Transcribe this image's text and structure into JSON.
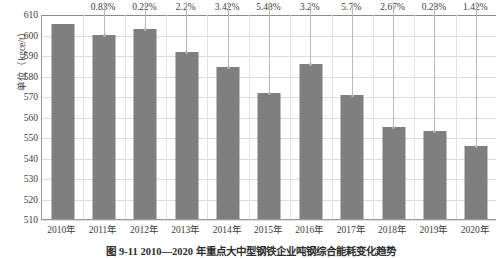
{
  "chart_data": {
    "type": "bar",
    "title": "图 9-11  2010—2020 年重点大中型钢铁企业吨钢综合能耗变化趋势",
    "xlabel": "",
    "ylabel": "单位（kgce/t）",
    "ylim": [
      510,
      610
    ],
    "yticks": [
      510,
      520,
      530,
      540,
      550,
      560,
      570,
      580,
      590,
      600,
      610
    ],
    "grid": true,
    "legend": "none",
    "categories": [
      "2010年",
      "2011年",
      "2012年",
      "2013年",
      "2014年",
      "2015年",
      "2016年",
      "2017年",
      "2018年",
      "2019年",
      "2020年"
    ],
    "values": [
      605.0,
      600.0,
      602.5,
      591.5,
      584.0,
      571.5,
      585.5,
      570.5,
      555.0,
      553.0,
      545.5
    ],
    "annotations": [
      "",
      "0.83%",
      "0.22%",
      "2.2%",
      "3.42%",
      "5.48%",
      "3.2%",
      "5.7%",
      "2.67%",
      "0.28%",
      "1.42%"
    ],
    "series_color": "#7f7f7f"
  },
  "figure": {
    "caption": "图 9-11  2010—2020 年重点大中型钢铁企业吨钢综合能耗变化趋势",
    "y_axis_title": "单位（kgce/t）"
  },
  "colors": {
    "bar": "#7f7f7f",
    "grid": "#dcdcdc",
    "axis": "#9a9a9a",
    "leader": "#b9b9b9",
    "text": "#3c3c3c"
  }
}
